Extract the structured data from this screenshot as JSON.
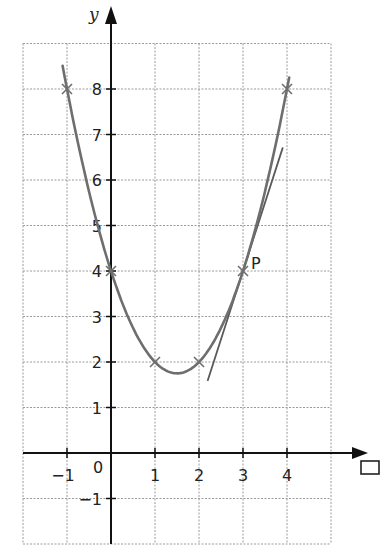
{
  "chart_data": {
    "type": "line",
    "title": "",
    "function": "y = x^2 - 3x + 4",
    "xlabel": "□",
    "ylabel": "y",
    "xlim": [
      -2,
      5
    ],
    "ylim": [
      -2,
      9
    ],
    "grid": true,
    "x_tick_labels": [
      "-1",
      "0",
      "1",
      "2",
      "3",
      "4"
    ],
    "y_tick_labels": [
      "-1",
      "1",
      "2",
      "3",
      "4",
      "5",
      "6",
      "7",
      "8"
    ],
    "x_ticks": [
      -1,
      1,
      2,
      3,
      4
    ],
    "y_ticks": [
      -1,
      1,
      2,
      3,
      4,
      5,
      6,
      7,
      8
    ],
    "origin_label": "0",
    "series": [
      {
        "name": "curve",
        "style": "smooth",
        "x_range": [
          -1.1,
          4.05
        ],
        "marked_points": [
          {
            "x": -1,
            "y": 8
          },
          {
            "x": 0,
            "y": 4
          },
          {
            "x": 1,
            "y": 2
          },
          {
            "x": 2,
            "y": 2
          },
          {
            "x": 3,
            "y": 4
          },
          {
            "x": 4,
            "y": 8
          }
        ],
        "minimum": {
          "x": 1.5,
          "y": 1.75
        }
      },
      {
        "name": "tangent at P",
        "style": "line",
        "equation": "y = 3x - 5",
        "from": {
          "x": 2.2,
          "y": 1.6
        },
        "to": {
          "x": 3.9,
          "y": 6.7
        }
      }
    ],
    "annotations": [
      {
        "text": "P",
        "x": 3,
        "y": 4
      }
    ]
  },
  "labels": {
    "y_axis": "y",
    "x_axis_placeholder": "□",
    "point_p": "P",
    "origin": "0"
  },
  "colors": {
    "curve": "#6e6e6e",
    "tangent": "#5a5a5a",
    "grid": "#9a9a9a",
    "axis": "#111111",
    "background": "#ffffff"
  }
}
